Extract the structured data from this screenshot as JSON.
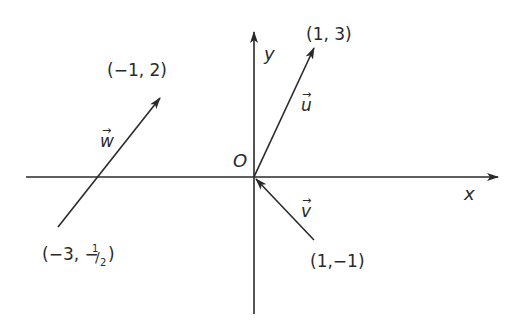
{
  "diagram": {
    "type": "vector-plane",
    "colors": {
      "ink": "#2a2a2a",
      "background": "#ffffff"
    },
    "axes": {
      "x_label": "x",
      "y_label": "y",
      "origin_label": "O"
    },
    "vectors": [
      {
        "name": "u",
        "label": "u",
        "tail": [
          0,
          0
        ],
        "head": [
          1,
          3
        ],
        "head_label": "(1, 3)"
      },
      {
        "name": "w",
        "label": "w",
        "tail": [
          -3,
          -0.5
        ],
        "head": [
          -1,
          2
        ],
        "tail_label": "(−3, −½)",
        "head_label": "(−1, 2)"
      },
      {
        "name": "v",
        "label": "v",
        "tail": [
          1,
          -1
        ],
        "head": [
          0,
          0
        ],
        "tail_label": "(1,−1)"
      }
    ],
    "point_labels": {
      "u_head": "(1, 3)",
      "w_head": "(−1, 2)",
      "w_tail_prefix": "(−3, −",
      "w_tail_num": "1",
      "w_tail_den": "2",
      "w_tail_suffix": ")",
      "v_tail": "(1,−1)"
    },
    "vector_arrow_glyph": "→"
  }
}
